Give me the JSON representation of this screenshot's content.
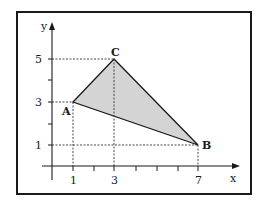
{
  "diagram": {
    "type": "coordinate-plane-triangle",
    "axes": {
      "x_label": "x",
      "y_label": "y",
      "x_ticks_labeled": [
        "1",
        "3",
        "7"
      ],
      "y_ticks_labeled": [
        "1",
        "3",
        "5"
      ]
    },
    "points": [
      {
        "name": "A",
        "x": 1,
        "y": 3
      },
      {
        "name": "B",
        "x": 7,
        "y": 1
      },
      {
        "name": "C",
        "x": 3,
        "y": 5
      }
    ],
    "colors": {
      "fill": "#d4d4d4",
      "stroke": "#1a1a1a",
      "border": "#1a1a1a"
    }
  }
}
